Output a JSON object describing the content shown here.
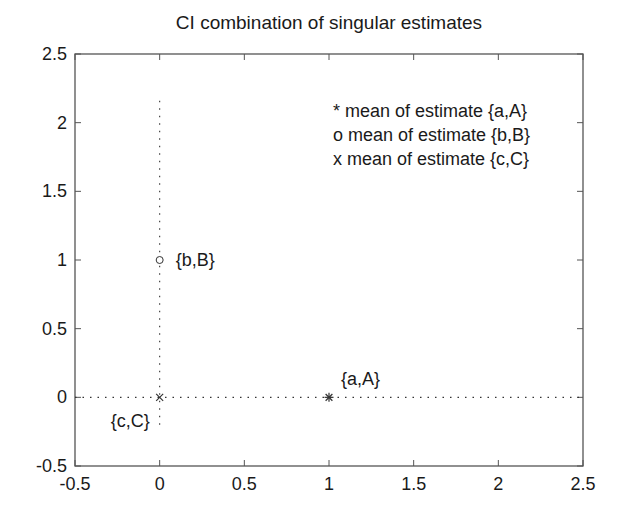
{
  "chart_data": {
    "type": "scatter",
    "title": "CI combination of singular estimates",
    "xlabel": "",
    "ylabel": "",
    "xlim": [
      -0.5,
      2.5
    ],
    "ylim": [
      -0.5,
      2.5
    ],
    "xticks": [
      -0.5,
      0,
      0.5,
      1,
      1.5,
      2,
      2.5
    ],
    "yticks": [
      -0.5,
      0,
      0.5,
      1,
      1.5,
      2,
      2.5
    ],
    "xtick_labels": [
      "-0.5",
      "0",
      "0.5",
      "1",
      "1.5",
      "2",
      "2.5"
    ],
    "ytick_labels": [
      "-0.5",
      "0",
      "0.5",
      "1",
      "1.5",
      "2",
      "2.5"
    ],
    "grid": false,
    "points": [
      {
        "name": "{a,A}",
        "x": 1,
        "y": 0,
        "marker": "*",
        "label": "{a,A}"
      },
      {
        "name": "{b,B}",
        "x": 0,
        "y": 1,
        "marker": "o",
        "label": "{b,B}"
      },
      {
        "name": "{c,C}",
        "x": 0,
        "y": 0,
        "marker": "x",
        "label": "{c,C}"
      }
    ],
    "lines": [
      {
        "name": "horizontal-dotted",
        "style": "dotted",
        "x": [
          -0.5,
          2.5
        ],
        "y": [
          0,
          0
        ]
      },
      {
        "name": "vertical-dotted",
        "style": "dotted",
        "x": [
          0,
          0
        ],
        "y": [
          -0.2,
          2.2
        ]
      }
    ],
    "legend": [
      "* mean of estimate {a,A}",
      "o mean of estimate {b,B}",
      "x mean of estimate {c,C}"
    ],
    "legend_position": "upper right (text annotation)"
  },
  "colors": {
    "axis": "#555555",
    "line": "#333333",
    "text": "#1a1a1a",
    "background": "#ffffff"
  }
}
